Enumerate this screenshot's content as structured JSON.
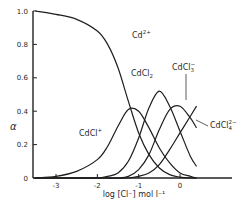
{
  "chart_data": {
    "type": "line",
    "title": "",
    "xlabel": "log [Cl⁻] mol l⁻¹",
    "ylabel": "α",
    "xlim": [
      -3.55,
      0.5
    ],
    "ylim": [
      0,
      1.0
    ],
    "grid": false,
    "legend": "inline labels",
    "x_ticks": [
      -3,
      -2,
      -1,
      0
    ],
    "x_tick_labels": [
      "-3",
      "-2",
      "-1",
      "0"
    ],
    "y_ticks": [
      0,
      0.2,
      0.4,
      0.6,
      0.8,
      1.0
    ],
    "y_tick_labels": [
      "0",
      "0.2",
      "0.4",
      "0.6",
      "0.8",
      "1.0"
    ],
    "x": [
      -3.5,
      -3.0,
      -2.5,
      -2.0,
      -1.75,
      -1.5,
      -1.25,
      -1.0,
      -0.75,
      -0.5,
      -0.25,
      0.0,
      0.25,
      0.4
    ],
    "series": [
      {
        "name": "Cd²⁺",
        "label": "Cd",
        "sup": "2+",
        "values": [
          1.0,
          0.98,
          0.95,
          0.88,
          0.8,
          0.66,
          0.46,
          0.27,
          0.14,
          0.06,
          0.02,
          0.005,
          0.0,
          0.0
        ]
      },
      {
        "name": "CdCl⁺",
        "label": "CdCl",
        "sup": "+",
        "values": [
          0.0,
          0.01,
          0.04,
          0.11,
          0.19,
          0.31,
          0.41,
          0.4,
          0.3,
          0.18,
          0.09,
          0.03,
          0.01,
          0.0
        ]
      },
      {
        "name": "CdCl₂",
        "label": "CdCl",
        "sub": "2",
        "values": [
          0.0,
          0.0,
          0.0,
          0.0,
          0.01,
          0.03,
          0.1,
          0.24,
          0.42,
          0.52,
          0.43,
          0.28,
          0.13,
          0.07
        ]
      },
      {
        "name": "CdCl₃⁻",
        "label": "CdCl",
        "sub": "3",
        "sup": "−",
        "values": [
          0.0,
          0.0,
          0.0,
          0.0,
          0.0,
          0.0,
          0.01,
          0.05,
          0.14,
          0.29,
          0.41,
          0.43,
          0.36,
          0.3
        ]
      },
      {
        "name": "CdCl₄²⁻",
        "label": "CdCl",
        "sub": "4",
        "sup": "2−",
        "values": [
          0.0,
          0.0,
          0.0,
          0.0,
          0.0,
          0.0,
          0.0,
          0.01,
          0.03,
          0.08,
          0.17,
          0.27,
          0.37,
          0.43
        ]
      }
    ]
  }
}
